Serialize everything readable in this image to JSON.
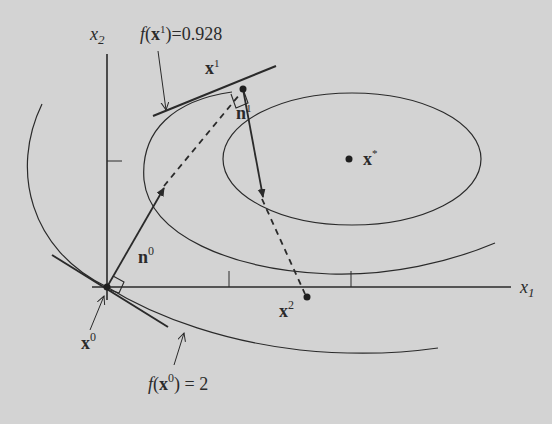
{
  "figure": {
    "background": "#d3d3d3",
    "ink": "#2a2a2a",
    "axes": {
      "x_label": "x",
      "x_label_sub": "1",
      "y_label": "x",
      "y_label_sub": "2"
    },
    "points": {
      "x0": {
        "base": "x",
        "sup": "0"
      },
      "x1": {
        "base": "x",
        "sup": "1"
      },
      "x2": {
        "base": "x",
        "sup": "2"
      },
      "xstar": {
        "base": "x",
        "sup": "*"
      }
    },
    "vectors": {
      "n0": {
        "base": "n",
        "sup": "0"
      },
      "n1": {
        "base": "n",
        "sup": "1"
      }
    },
    "annotations": {
      "f_x1": {
        "f": "f",
        "open": "(",
        "base": "x",
        "sup": "1",
        "rest": ")=0.928"
      },
      "f_x0": {
        "f": "f",
        "open": "(",
        "base": "x",
        "sup": "0",
        "rest": ") = 2"
      }
    }
  }
}
